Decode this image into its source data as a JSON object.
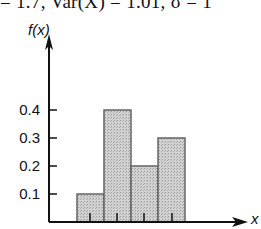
{
  "header": {
    "text": "= 1.7, Var(X) = 1.01, σ = 1"
  },
  "chart_data": {
    "type": "bar",
    "title": "",
    "xlabel": "x",
    "ylabel": "f(x)",
    "categories": [
      "0",
      "1",
      "2",
      "3"
    ],
    "values": [
      0.1,
      0.4,
      0.2,
      0.3
    ],
    "ylim": [
      0,
      0.4
    ],
    "yticks": [
      "0.1",
      "0.2",
      "0.3",
      "0.4"
    ],
    "grid": false,
    "legend": null,
    "bar_color": "#c8c8c8",
    "bar_edge_color": "#666666"
  }
}
